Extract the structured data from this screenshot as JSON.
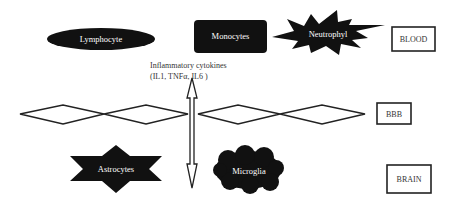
{
  "diagram": {
    "colors": {
      "background": "#ffffff",
      "cell_fill": "#111111",
      "cell_text": "#ffffff",
      "line": "#222222",
      "label_text": "#333333"
    },
    "cells": {
      "lymphocyte": {
        "label": "Lymphocyte",
        "shape": "ellipse"
      },
      "monocytes": {
        "label": "Monocytes",
        "shape": "rounded-rectangle"
      },
      "neutrophyl": {
        "label": "Neutrophyl",
        "shape": "explosion"
      },
      "astrocytes": {
        "label": "Astrocytes",
        "shape": "six-point-star"
      },
      "microglia": {
        "label": "Microglia",
        "shape": "cloud"
      }
    },
    "cytokines": {
      "line1": "Inflammatory cytokines",
      "line2": "(IL1, TNFα, IL6 )",
      "arrow": "double-headed-vertical"
    },
    "layers": {
      "blood": "BLOOD",
      "bbb": "BBB",
      "brain": "BRAIN"
    },
    "barrier": {
      "diamond_count": 4
    }
  }
}
